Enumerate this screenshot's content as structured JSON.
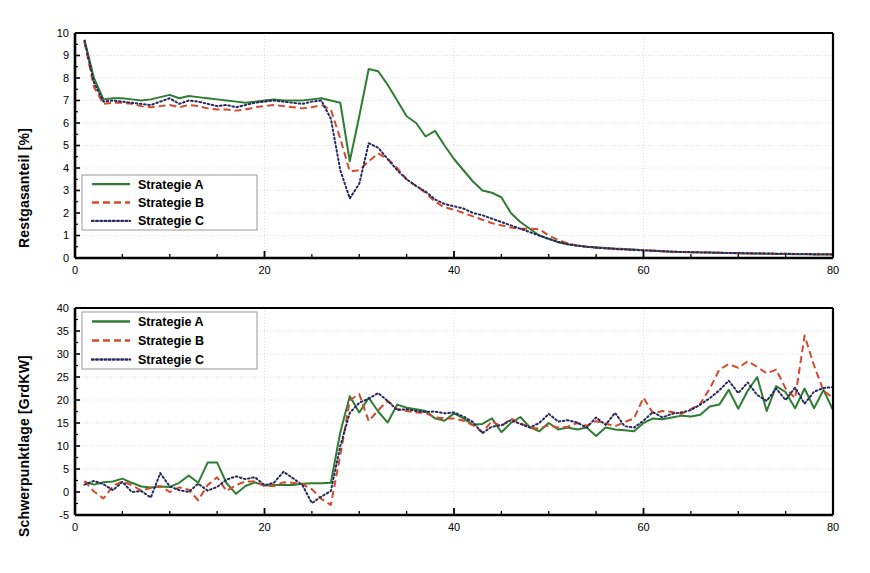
{
  "figure": {
    "background": "#ffffff",
    "colors": {
      "series_a": "#2f7d32",
      "series_b": "#d6482c",
      "series_c": "#262a5e",
      "axis": "#000000",
      "grid": "#d9d9d9"
    }
  },
  "legend": {
    "items": [
      {
        "label": "Strategie A",
        "style": "solid",
        "color": "#2f7d32"
      },
      {
        "label": "Strategie B",
        "style": "dashed",
        "color": "#d6482c"
      },
      {
        "label": "Strategie C",
        "style": "dotted",
        "color": "#262a5e"
      }
    ]
  },
  "chart_data": [
    {
      "id": "restgasanteil",
      "type": "line",
      "title": "",
      "xlabel": "",
      "ylabel": "Restgasanteil [%]",
      "xlim": [
        0,
        80
      ],
      "ylim": [
        0,
        10
      ],
      "xticks": [
        0,
        20,
        40,
        60,
        80
      ],
      "xtick_labels": [
        "0",
        "20",
        "40",
        "60",
        "80"
      ],
      "xminor_step": 5,
      "yticks": [
        0,
        1,
        2,
        3,
        4,
        5,
        6,
        7,
        8,
        9,
        10
      ],
      "ytick_labels": [
        "0",
        "1",
        "2",
        "3",
        "4",
        "5",
        "6",
        "7",
        "8",
        "9",
        "10"
      ],
      "grid": true,
      "legend_position": "lower-left",
      "x": [
        1,
        2,
        3,
        4,
        5,
        6,
        7,
        8,
        9,
        10,
        11,
        12,
        13,
        14,
        15,
        16,
        17,
        18,
        19,
        20,
        21,
        22,
        23,
        24,
        25,
        26,
        27,
        28,
        29,
        30,
        31,
        32,
        33,
        34,
        35,
        36,
        37,
        38,
        39,
        40,
        41,
        42,
        43,
        44,
        45,
        46,
        47,
        48,
        49,
        50,
        51,
        52,
        53,
        54,
        55,
        56,
        57,
        58,
        59,
        60,
        61,
        62,
        63,
        64,
        65,
        66,
        67,
        68,
        69,
        70,
        71,
        72,
        73,
        74,
        75,
        76,
        77,
        78,
        79,
        80
      ],
      "series": [
        {
          "name": "Strategie A",
          "values": [
            9.7,
            8.0,
            7.05,
            7.1,
            7.1,
            7.05,
            7.0,
            7.05,
            7.15,
            7.25,
            7.1,
            7.2,
            7.15,
            7.1,
            7.05,
            7.0,
            6.95,
            6.9,
            6.95,
            7.0,
            7.05,
            7.0,
            7.0,
            7.0,
            7.05,
            7.1,
            7.0,
            6.9,
            4.3,
            6.3,
            8.4,
            8.3,
            7.7,
            7.0,
            6.3,
            6.0,
            5.4,
            5.65,
            5.0,
            4.4,
            3.9,
            3.4,
            3.0,
            2.9,
            2.7,
            2.0,
            1.6,
            1.3,
            1.0,
            0.85,
            0.7,
            0.6,
            0.55,
            0.5,
            0.48,
            0.45,
            0.42,
            0.4,
            0.38,
            0.35,
            0.33,
            0.3,
            0.28,
            0.27,
            0.26,
            0.25,
            0.24,
            0.23,
            0.22,
            0.21,
            0.2,
            0.2,
            0.19,
            0.18,
            0.18,
            0.17,
            0.17,
            0.16,
            0.16,
            0.15
          ]
        },
        {
          "name": "Strategie B",
          "values": [
            9.6,
            7.6,
            6.85,
            6.9,
            6.9,
            6.85,
            6.75,
            6.7,
            6.75,
            6.8,
            6.7,
            6.8,
            6.75,
            6.65,
            6.6,
            6.6,
            6.55,
            6.6,
            6.7,
            6.75,
            6.8,
            6.75,
            6.7,
            6.65,
            6.7,
            6.8,
            6.6,
            5.3,
            3.85,
            3.9,
            4.3,
            4.65,
            4.4,
            4.0,
            3.5,
            3.2,
            2.9,
            2.5,
            2.25,
            2.15,
            2.0,
            1.85,
            1.7,
            1.55,
            1.45,
            1.35,
            1.3,
            1.3,
            1.28,
            1.0,
            0.8,
            0.65,
            0.55,
            0.5,
            0.46,
            0.43,
            0.4,
            0.38,
            0.36,
            0.34,
            0.32,
            0.3,
            0.28,
            0.27,
            0.26,
            0.25,
            0.24,
            0.23,
            0.22,
            0.22,
            0.21,
            0.2,
            0.2,
            0.19,
            0.19,
            0.18,
            0.18,
            0.17,
            0.17,
            0.16
          ]
        },
        {
          "name": "Strategie C",
          "values": [
            9.65,
            7.8,
            6.95,
            7.0,
            6.95,
            6.9,
            6.85,
            6.8,
            6.95,
            7.1,
            6.85,
            7.0,
            6.95,
            6.85,
            6.75,
            6.8,
            6.7,
            6.8,
            6.9,
            6.95,
            7.0,
            6.95,
            6.9,
            6.85,
            6.95,
            7.0,
            6.2,
            3.9,
            2.65,
            3.3,
            5.1,
            4.9,
            4.4,
            3.9,
            3.5,
            3.2,
            2.95,
            2.6,
            2.4,
            2.3,
            2.2,
            2.0,
            1.9,
            1.75,
            1.6,
            1.45,
            1.3,
            1.15,
            1.0,
            0.85,
            0.72,
            0.62,
            0.55,
            0.5,
            0.46,
            0.43,
            0.4,
            0.38,
            0.36,
            0.34,
            0.32,
            0.3,
            0.28,
            0.27,
            0.26,
            0.25,
            0.24,
            0.23,
            0.22,
            0.22,
            0.21,
            0.2,
            0.2,
            0.19,
            0.19,
            0.18,
            0.18,
            0.17,
            0.17,
            0.16
          ]
        }
      ]
    },
    {
      "id": "schwerpunktlage",
      "type": "line",
      "title": "",
      "xlabel": "Arbeitsspielzähler",
      "ylabel": "Schwerpunktlage [GrdKW]",
      "xlim": [
        0,
        80
      ],
      "ylim": [
        -5,
        40
      ],
      "xticks": [
        0,
        20,
        40,
        60,
        80
      ],
      "xtick_labels": [
        "0",
        "20",
        "40",
        "60",
        "80"
      ],
      "xminor_step": 5,
      "yticks": [
        -5,
        0,
        5,
        10,
        15,
        20,
        25,
        30,
        35,
        40
      ],
      "ytick_labels": [
        "-5",
        "0",
        "5",
        "10",
        "15",
        "20",
        "25",
        "30",
        "35",
        "40"
      ],
      "grid": true,
      "legend_position": "upper-left",
      "x": [
        1,
        2,
        3,
        4,
        5,
        6,
        7,
        8,
        9,
        10,
        11,
        12,
        13,
        14,
        15,
        16,
        17,
        18,
        19,
        20,
        21,
        22,
        23,
        24,
        25,
        26,
        27,
        28,
        29,
        30,
        31,
        32,
        33,
        34,
        35,
        36,
        37,
        38,
        39,
        40,
        41,
        42,
        43,
        44,
        45,
        46,
        47,
        48,
        49,
        50,
        51,
        52,
        53,
        54,
        55,
        56,
        57,
        58,
        59,
        60,
        61,
        62,
        63,
        64,
        65,
        66,
        67,
        68,
        69,
        70,
        71,
        72,
        73,
        74,
        75,
        76,
        77,
        78,
        79,
        80
      ],
      "series": [
        {
          "name": "Strategie A",
          "values": [
            2.2,
            1.6,
            2.1,
            2.3,
            2.9,
            2.0,
            1.2,
            1.0,
            1.2,
            1.1,
            2.0,
            3.6,
            2.0,
            6.4,
            6.4,
            1.9,
            -0.4,
            1.3,
            2.1,
            1.4,
            1.5,
            1.5,
            1.5,
            1.8,
            1.9,
            1.9,
            2.0,
            13.0,
            20.8,
            17.3,
            20.5,
            17.5,
            15.1,
            19.0,
            18.3,
            18.0,
            17.6,
            16.0,
            15.5,
            17.1,
            16.0,
            14.6,
            14.8,
            16.0,
            13.0,
            15.0,
            16.3,
            14.1,
            13.2,
            15.0,
            13.6,
            14.0,
            13.6,
            14.0,
            12.2,
            14.0,
            13.6,
            13.4,
            13.2,
            15.0,
            16.0,
            15.8,
            16.2,
            16.6,
            16.4,
            16.8,
            18.6,
            19.0,
            22.2,
            18.1,
            22.0,
            25.0,
            17.6,
            23.0,
            21.7,
            18.2,
            22.5,
            18.2,
            22.2,
            17.8
          ]
        },
        {
          "name": "Strategie B",
          "values": [
            2.4,
            0.1,
            -1.4,
            1.3,
            2.3,
            1.5,
            0.3,
            0.9,
            1.3,
            0.0,
            1.0,
            0.5,
            -1.8,
            1.5,
            3.2,
            0.2,
            1.5,
            2.3,
            2.3,
            1.3,
            1.3,
            2.1,
            2.0,
            1.7,
            0.6,
            -1.5,
            -2.8,
            8.0,
            19.9,
            21.3,
            15.4,
            17.8,
            19.8,
            18.1,
            17.6,
            17.3,
            17.2,
            16.2,
            16.0,
            16.0,
            15.5,
            14.5,
            13.0,
            15.4,
            14.2,
            16.0,
            15.0,
            14.0,
            13.8,
            14.5,
            14.0,
            14.2,
            15.0,
            14.4,
            15.4,
            14.9,
            14.3,
            15.2,
            16.0,
            20.5,
            17.1,
            17.6,
            17.4,
            17.0,
            18.0,
            19.2,
            22.5,
            26.6,
            27.8,
            27.0,
            28.4,
            27.2,
            25.8,
            26.6,
            22.5,
            20.4,
            34.0,
            27.5,
            22.0,
            20.5
          ]
        },
        {
          "name": "Strategie C",
          "values": [
            1.6,
            2.4,
            1.7,
            0.4,
            2.2,
            0.0,
            0.2,
            -1.2,
            4.1,
            1.2,
            0.4,
            0.0,
            1.8,
            0.3,
            1.1,
            2.7,
            3.4,
            2.8,
            3.2,
            1.5,
            2.0,
            4.4,
            3.0,
            1.5,
            -2.4,
            -1.0,
            0.2,
            10.0,
            17.2,
            19.4,
            20.3,
            21.5,
            19.8,
            17.8,
            18.0,
            17.6,
            17.4,
            17.5,
            17.1,
            17.3,
            16.4,
            15.2,
            12.8,
            14.2,
            14.5,
            15.6,
            14.8,
            14.0,
            15.0,
            17.0,
            15.3,
            15.6,
            15.1,
            14.0,
            16.2,
            14.6,
            17.2,
            14.3,
            14.0,
            15.5,
            17.4,
            16.2,
            17.0,
            17.3,
            17.8,
            19.0,
            20.4,
            22.1,
            24.2,
            21.5,
            23.8,
            21.1,
            19.8,
            22.5,
            20.0,
            22.7,
            19.2,
            21.8,
            22.6,
            22.8
          ]
        }
      ]
    }
  ]
}
